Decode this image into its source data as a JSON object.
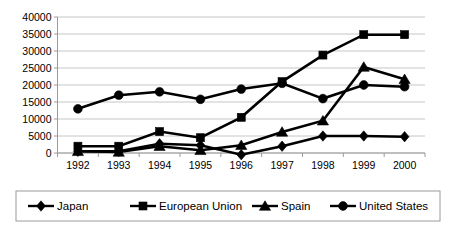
{
  "chart_data": {
    "type": "line",
    "title": "",
    "subtitle": "",
    "xlabel": "",
    "ylabel": "",
    "categories": [
      "1992",
      "1993",
      "1994",
      "1995",
      "1996",
      "1997",
      "1998",
      "1999",
      "2000"
    ],
    "ylim": [
      0,
      40000
    ],
    "ytick_step": 5000,
    "yticks": [
      "0",
      "5000",
      "10000",
      "15000",
      "20000",
      "25000",
      "30000",
      "35000",
      "40000"
    ],
    "grid": "horizontal",
    "legend_position": "bottom",
    "series": [
      {
        "name": "Japan",
        "marker": "diamond",
        "color": "#000000",
        "values": [
          500,
          500,
          2700,
          2300,
          -500,
          2000,
          5000,
          5000,
          4800
        ]
      },
      {
        "name": "European Union",
        "marker": "square",
        "color": "#000000",
        "values": [
          2000,
          2000,
          6300,
          4500,
          10500,
          21000,
          28800,
          34800,
          34800
        ]
      },
      {
        "name": "Spain",
        "marker": "triangle",
        "color": "#000000",
        "values": [
          500,
          300,
          2000,
          800,
          2300,
          6200,
          9500,
          25300,
          21700
        ]
      },
      {
        "name": "United States",
        "marker": "circle",
        "color": "#000000",
        "values": [
          13000,
          17000,
          18000,
          15800,
          18800,
          20500,
          16000,
          20000,
          19500
        ]
      }
    ]
  },
  "legend": {
    "entries": [
      {
        "label": "Japan",
        "marker": "diamond"
      },
      {
        "label": "European Union",
        "marker": "square"
      },
      {
        "label": "Spain",
        "marker": "triangle"
      },
      {
        "label": "United States",
        "marker": "circle"
      }
    ]
  },
  "colors": {
    "plot_background": "#ffffff",
    "grid": "#b8b8b8",
    "axis": "#9a9a9a",
    "series": "#000000",
    "legend_border": "#9a9a9a"
  }
}
